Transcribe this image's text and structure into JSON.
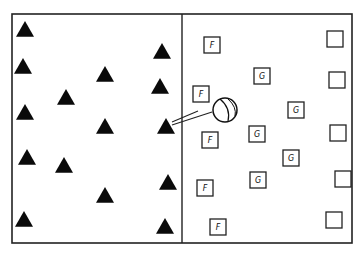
{
  "field": {
    "frame": {
      "x": 12,
      "y": 14,
      "w": 340,
      "h": 229
    },
    "divider_x": 182,
    "line_color": "#222222"
  },
  "triangles": [
    {
      "x": 25,
      "y": 30
    },
    {
      "x": 23,
      "y": 67
    },
    {
      "x": 25,
      "y": 113
    },
    {
      "x": 27,
      "y": 158
    },
    {
      "x": 24,
      "y": 220
    },
    {
      "x": 66,
      "y": 98
    },
    {
      "x": 64,
      "y": 166
    },
    {
      "x": 105,
      "y": 75
    },
    {
      "x": 105,
      "y": 127
    },
    {
      "x": 105,
      "y": 196
    },
    {
      "x": 162,
      "y": 52
    },
    {
      "x": 160,
      "y": 87
    },
    {
      "x": 166,
      "y": 127
    },
    {
      "x": 168,
      "y": 183
    },
    {
      "x": 165,
      "y": 227
    }
  ],
  "labeled_squares": [
    {
      "x": 212,
      "y": 45,
      "label": "F"
    },
    {
      "x": 201,
      "y": 94,
      "label": "F"
    },
    {
      "x": 210,
      "y": 140,
      "label": "F"
    },
    {
      "x": 205,
      "y": 188,
      "label": "F"
    },
    {
      "x": 218,
      "y": 227,
      "label": "F"
    },
    {
      "x": 262,
      "y": 76,
      "label": "G"
    },
    {
      "x": 296,
      "y": 110,
      "label": "G"
    },
    {
      "x": 257,
      "y": 134,
      "label": "G"
    },
    {
      "x": 291,
      "y": 158,
      "label": "G"
    },
    {
      "x": 258,
      "y": 180,
      "label": "G"
    }
  ],
  "empty_squares": [
    {
      "x": 335,
      "y": 39
    },
    {
      "x": 337,
      "y": 80
    },
    {
      "x": 338,
      "y": 133
    },
    {
      "x": 343,
      "y": 179
    },
    {
      "x": 334,
      "y": 220
    }
  ],
  "ball": {
    "x": 225,
    "y": 110,
    "r": 12
  },
  "pass_line": {
    "x1": 172,
    "y1": 125,
    "x2": 212,
    "y2": 112
  }
}
